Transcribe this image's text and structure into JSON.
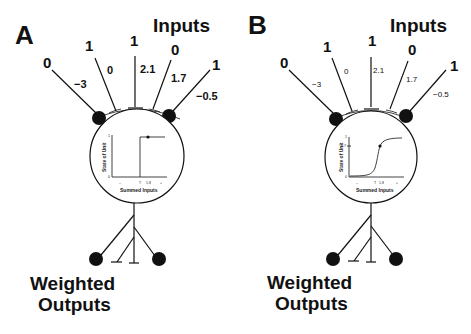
{
  "panels": [
    {
      "letter": "A",
      "title_inputs": "Inputs",
      "title_outputs_line1": "Weighted",
      "title_outputs_line2": "Outputs",
      "inputs": [
        "0",
        "1",
        "1",
        "0",
        "1"
      ],
      "weights": [
        "−3",
        "0",
        "2.1",
        "1.7",
        "−0.5"
      ],
      "activation": {
        "type": "step",
        "ylabel": "State of Unit",
        "xlabel": "Summed Inputs",
        "y_ticks": [
          "1",
          "0"
        ],
        "x_ticks": [
          "–",
          "T",
          "1.8",
          "+"
        ]
      }
    },
    {
      "letter": "B",
      "title_inputs": "Inputs",
      "title_outputs_line1": "Weighted",
      "title_outputs_line2": "Outputs",
      "inputs": [
        "0",
        "1",
        "1",
        "0",
        "1"
      ],
      "weights": [
        "−3",
        "0",
        "2.1",
        "1.7",
        "−0.5"
      ],
      "activation": {
        "type": "sigmoid",
        "ylabel": "State of Unit",
        "xlabel": "Summed Inputs",
        "y_ticks": [
          "1",
          "0.7",
          "0"
        ],
        "x_ticks": [
          "–",
          "T",
          "1.8",
          "+"
        ]
      }
    }
  ]
}
